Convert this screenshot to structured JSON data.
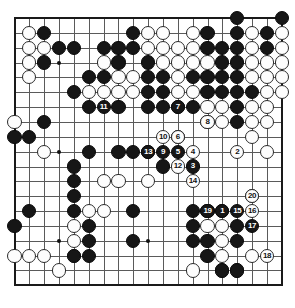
{
  "diagram": {
    "type": "go-board-diagram",
    "board_size": 19,
    "background_color": "#ffffff",
    "line_color": "#5a5a5a",
    "border_color": "#1a1a1a",
    "black_color": "#161616",
    "white_color": "#fdfdfd",
    "star_points": [
      {
        "col": 4,
        "row": 4
      },
      {
        "col": 10,
        "row": 4
      },
      {
        "col": 16,
        "row": 4
      },
      {
        "col": 4,
        "row": 10
      },
      {
        "col": 10,
        "row": 10
      },
      {
        "col": 16,
        "row": 10
      },
      {
        "col": 4,
        "row": 16
      },
      {
        "col": 10,
        "row": 16
      },
      {
        "col": 16,
        "row": 16
      }
    ],
    "geometry": {
      "origin_x": 14.5,
      "origin_y": 18.0,
      "spacing": 14.85,
      "stone_diameter": 14.2,
      "board_left": 7,
      "board_top": 11,
      "board_right": 288,
      "board_bottom": 297
    },
    "black_stones": [
      {
        "col": 19,
        "row": 1
      },
      {
        "col": 16,
        "row": 1
      },
      {
        "col": 3,
        "row": 2
      },
      {
        "col": 9,
        "row": 2
      },
      {
        "col": 14,
        "row": 2
      },
      {
        "col": 16,
        "row": 2
      },
      {
        "col": 18,
        "row": 2
      },
      {
        "col": 4,
        "row": 3
      },
      {
        "col": 5,
        "row": 3
      },
      {
        "col": 7,
        "row": 3
      },
      {
        "col": 8,
        "row": 3
      },
      {
        "col": 9,
        "row": 3
      },
      {
        "col": 14,
        "row": 3
      },
      {
        "col": 15,
        "row": 3
      },
      {
        "col": 16,
        "row": 3
      },
      {
        "col": 18,
        "row": 3
      },
      {
        "col": 3,
        "row": 4
      },
      {
        "col": 8,
        "row": 4
      },
      {
        "col": 10,
        "row": 4
      },
      {
        "col": 15,
        "row": 4
      },
      {
        "col": 16,
        "row": 4
      },
      {
        "col": 6,
        "row": 5
      },
      {
        "col": 7,
        "row": 5
      },
      {
        "col": 10,
        "row": 5
      },
      {
        "col": 11,
        "row": 5
      },
      {
        "col": 13,
        "row": 5
      },
      {
        "col": 14,
        "row": 5
      },
      {
        "col": 15,
        "row": 5
      },
      {
        "col": 16,
        "row": 5
      },
      {
        "col": 5,
        "row": 6
      },
      {
        "col": 10,
        "row": 6
      },
      {
        "col": 11,
        "row": 6
      },
      {
        "col": 14,
        "row": 6
      },
      {
        "col": 15,
        "row": 6
      },
      {
        "col": 16,
        "row": 6
      },
      {
        "col": 17,
        "row": 6
      },
      {
        "col": 6,
        "row": 7
      },
      {
        "col": 8,
        "row": 7
      },
      {
        "col": 10,
        "row": 7
      },
      {
        "col": 11,
        "row": 7
      },
      {
        "col": 12,
        "row": 7
      },
      {
        "col": 13,
        "row": 7
      },
      {
        "col": 16,
        "row": 7
      },
      {
        "col": 3,
        "row": 8
      },
      {
        "col": 16,
        "row": 8
      },
      {
        "col": 1,
        "row": 9
      },
      {
        "col": 2,
        "row": 9
      },
      {
        "col": 12,
        "row": 9
      },
      {
        "col": 6,
        "row": 10
      },
      {
        "col": 8,
        "row": 10
      },
      {
        "col": 9,
        "row": 10
      },
      {
        "col": 10,
        "row": 10
      },
      {
        "col": 11,
        "row": 11
      },
      {
        "col": 5,
        "row": 11
      },
      {
        "col": 5,
        "row": 12
      },
      {
        "col": 5,
        "row": 13
      },
      {
        "col": 5,
        "row": 14
      },
      {
        "col": 2,
        "row": 14
      },
      {
        "col": 9,
        "row": 14
      },
      {
        "col": 6,
        "row": 15
      },
      {
        "col": 1,
        "row": 15
      },
      {
        "col": 13,
        "row": 14
      },
      {
        "col": 14,
        "row": 14
      },
      {
        "col": 15,
        "row": 14
      },
      {
        "col": 13,
        "row": 15
      },
      {
        "col": 16,
        "row": 15
      },
      {
        "col": 6,
        "row": 16
      },
      {
        "col": 9,
        "row": 16
      },
      {
        "col": 13,
        "row": 16
      },
      {
        "col": 14,
        "row": 16
      },
      {
        "col": 16,
        "row": 16
      },
      {
        "col": 5,
        "row": 17
      },
      {
        "col": 6,
        "row": 17
      },
      {
        "col": 14,
        "row": 17
      },
      {
        "col": 15,
        "row": 18
      },
      {
        "col": 16,
        "row": 18
      }
    ],
    "white_stones": [
      {
        "col": 19,
        "row": 2
      },
      {
        "col": 2,
        "row": 2
      },
      {
        "col": 10,
        "row": 2
      },
      {
        "col": 11,
        "row": 2
      },
      {
        "col": 13,
        "row": 2
      },
      {
        "col": 17,
        "row": 2
      },
      {
        "col": 19,
        "row": 3
      },
      {
        "col": 2,
        "row": 3
      },
      {
        "col": 3,
        "row": 3
      },
      {
        "col": 10,
        "row": 3
      },
      {
        "col": 11,
        "row": 3
      },
      {
        "col": 12,
        "row": 3
      },
      {
        "col": 13,
        "row": 3
      },
      {
        "col": 17,
        "row": 3
      },
      {
        "col": 2,
        "row": 4
      },
      {
        "col": 7,
        "row": 4
      },
      {
        "col": 11,
        "row": 4
      },
      {
        "col": 12,
        "row": 4
      },
      {
        "col": 13,
        "row": 4
      },
      {
        "col": 14,
        "row": 4
      },
      {
        "col": 17,
        "row": 4
      },
      {
        "col": 18,
        "row": 4
      },
      {
        "col": 19,
        "row": 4
      },
      {
        "col": 2,
        "row": 5
      },
      {
        "col": 8,
        "row": 5
      },
      {
        "col": 9,
        "row": 5
      },
      {
        "col": 12,
        "row": 5
      },
      {
        "col": 17,
        "row": 5
      },
      {
        "col": 18,
        "row": 5
      },
      {
        "col": 19,
        "row": 5
      },
      {
        "col": 6,
        "row": 6
      },
      {
        "col": 7,
        "row": 6
      },
      {
        "col": 8,
        "row": 6
      },
      {
        "col": 9,
        "row": 6
      },
      {
        "col": 12,
        "row": 6
      },
      {
        "col": 13,
        "row": 6
      },
      {
        "col": 18,
        "row": 6
      },
      {
        "col": 19,
        "row": 6
      },
      {
        "col": 14,
        "row": 7
      },
      {
        "col": 15,
        "row": 7
      },
      {
        "col": 17,
        "row": 7
      },
      {
        "col": 18,
        "row": 7
      },
      {
        "col": 1,
        "row": 8
      },
      {
        "col": 14,
        "row": 8
      },
      {
        "col": 15,
        "row": 8
      },
      {
        "col": 17,
        "row": 8
      },
      {
        "col": 18,
        "row": 8
      },
      {
        "col": 17,
        "row": 9
      },
      {
        "col": 3,
        "row": 10
      },
      {
        "col": 18,
        "row": 10
      },
      {
        "col": 7,
        "row": 12
      },
      {
        "col": 8,
        "row": 12
      },
      {
        "col": 10,
        "row": 12
      },
      {
        "col": 6,
        "row": 14
      },
      {
        "col": 7,
        "row": 14
      },
      {
        "col": 5,
        "row": 15
      },
      {
        "col": 17,
        "row": 13
      },
      {
        "col": 14,
        "row": 15
      },
      {
        "col": 15,
        "row": 15
      },
      {
        "col": 5,
        "row": 16
      },
      {
        "col": 15,
        "row": 16
      },
      {
        "col": 1,
        "row": 17
      },
      {
        "col": 2,
        "row": 17
      },
      {
        "col": 3,
        "row": 17
      },
      {
        "col": 5,
        "row": 17
      },
      {
        "col": 15,
        "row": 17
      },
      {
        "col": 17,
        "row": 17
      },
      {
        "col": 4,
        "row": 18
      },
      {
        "col": 13,
        "row": 18
      },
      {
        "col": 15,
        "row": 18
      },
      {
        "col": 16,
        "row": 18
      }
    ],
    "moves": [
      {
        "number": "1",
        "col": 15,
        "row": 14,
        "color": "black"
      },
      {
        "number": "2",
        "col": 16,
        "row": 10,
        "color": "white"
      },
      {
        "number": "3",
        "col": 13,
        "row": 11,
        "color": "black"
      },
      {
        "number": "4",
        "col": 13,
        "row": 10,
        "color": "white"
      },
      {
        "number": "5",
        "col": 12,
        "row": 10,
        "color": "black"
      },
      {
        "number": "6",
        "col": 12,
        "row": 9,
        "color": "white"
      },
      {
        "number": "7",
        "col": 12,
        "row": 7,
        "color": "black"
      },
      {
        "number": "8",
        "col": 14,
        "row": 8,
        "color": "white"
      },
      {
        "number": "9",
        "col": 11,
        "row": 10,
        "color": "black"
      },
      {
        "number": "10",
        "col": 11,
        "row": 9,
        "color": "white"
      },
      {
        "number": "11",
        "col": 7,
        "row": 7,
        "color": "black"
      },
      {
        "number": "12",
        "col": 12,
        "row": 11,
        "color": "white"
      },
      {
        "number": "13",
        "col": 10,
        "row": 10,
        "color": "black"
      },
      {
        "number": "14",
        "col": 13,
        "row": 12,
        "color": "white"
      },
      {
        "number": "15",
        "col": 16,
        "row": 14,
        "color": "black"
      },
      {
        "number": "16",
        "col": 17,
        "row": 14,
        "color": "white"
      },
      {
        "number": "17",
        "col": 17,
        "row": 15,
        "color": "black"
      },
      {
        "number": "18",
        "col": 18,
        "row": 17,
        "color": "white"
      },
      {
        "number": "19",
        "col": 14,
        "row": 14,
        "color": "black"
      },
      {
        "number": "20",
        "col": 17,
        "row": 13,
        "color": "white"
      }
    ]
  }
}
